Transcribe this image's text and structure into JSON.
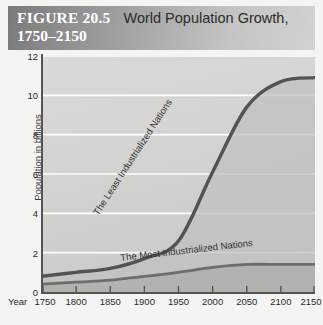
{
  "figure": {
    "number_label": "FIGURE 20.5",
    "title_line1": "World Population Growth,",
    "title_line2": "1750–2150"
  },
  "colors": {
    "header_dark": "#7a7a7a",
    "header_light": "#d2d2d0",
    "plot_background": "#d4d4d2",
    "gridline": "#ffffff",
    "axis": "#555452",
    "curve_least": "#55534f",
    "curve_most": "#6f6d68",
    "fill_least": "#c0c0bc",
    "fill_most": "#b4b4b0",
    "figure_number_text": "#ffffff",
    "title_text": "#2b2b2b"
  },
  "chart_data": {
    "type": "area",
    "title": "World Population Growth, 1750–2150",
    "xlabel": "Year",
    "ylabel": "Population in billions",
    "xlim": [
      1750,
      2150
    ],
    "ylim": [
      0,
      12
    ],
    "xticks": [
      1750,
      1800,
      1850,
      1900,
      1950,
      2000,
      2050,
      2100,
      2150
    ],
    "xticklabels": [
      "1750",
      "1800",
      "1850",
      "1900",
      "1950",
      "2000",
      "2050",
      "2100",
      "2150"
    ],
    "yticks": [
      0,
      2,
      4,
      6,
      8,
      10,
      12
    ],
    "yticklabels": [
      "0",
      "2",
      "4",
      "6",
      "8",
      "10",
      "12"
    ],
    "grid": "horizontal-white",
    "legend": "inline-curve-labels",
    "x": [
      1750,
      1800,
      1850,
      1900,
      1950,
      2000,
      2050,
      2100,
      2150
    ],
    "series": [
      {
        "name": "The Least Industrialized Nations",
        "label_position": "along-curve-rotated",
        "values": [
          0.8,
          1.0,
          1.2,
          1.7,
          2.6,
          6.1,
          9.4,
          10.7,
          10.9
        ]
      },
      {
        "name": "The Most Industrialized Nations",
        "label_position": "above-curve-rotated",
        "values": [
          0.4,
          0.5,
          0.6,
          0.8,
          1.0,
          1.25,
          1.4,
          1.4,
          1.4
        ]
      }
    ]
  }
}
